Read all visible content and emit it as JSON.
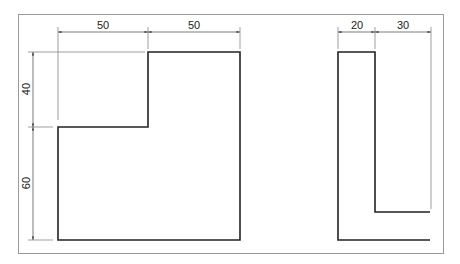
{
  "drawing": {
    "frame_color": "#9a9a9a",
    "outline_color": "#222222",
    "dim_color": "#555555",
    "front_view": {
      "dimensions": {
        "top_left": "50",
        "top_right": "50",
        "left_upper": "40",
        "left_lower": "60"
      }
    },
    "side_view": {
      "dimensions": {
        "top_left": "20",
        "top_right": "30"
      }
    }
  }
}
